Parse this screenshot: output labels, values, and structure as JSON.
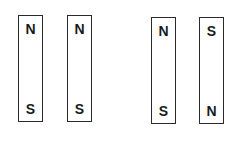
{
  "diagram": {
    "pairs": [
      {
        "magnets": [
          {
            "top": "N",
            "bottom": "S"
          },
          {
            "top": "N",
            "bottom": "S"
          }
        ]
      },
      {
        "magnets": [
          {
            "top": "N",
            "bottom": "S"
          },
          {
            "top": "S",
            "bottom": "N"
          }
        ]
      }
    ]
  }
}
